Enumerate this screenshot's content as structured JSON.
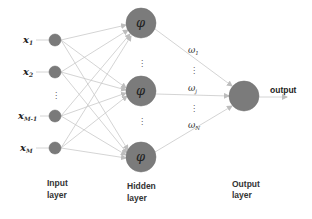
{
  "diagram": {
    "type": "neural-network",
    "layers": {
      "input": {
        "label_line1": "Input",
        "label_line2": "layer"
      },
      "hidden": {
        "label_line1": "Hidden",
        "label_line2": "layer"
      },
      "output": {
        "label_line1": "Output",
        "label_line2": "layer"
      }
    },
    "input_nodes": [
      {
        "symbol": "x",
        "sub": "1"
      },
      {
        "symbol": "x",
        "sub": "2"
      },
      {
        "symbol": "x",
        "sub": "M-1"
      },
      {
        "symbol": "x",
        "sub": "M"
      }
    ],
    "hidden_nodes": [
      {
        "symbol": "φ"
      },
      {
        "symbol": "φ"
      },
      {
        "symbol": "φ"
      }
    ],
    "weights": [
      {
        "symbol": "ω",
        "sub": "1"
      },
      {
        "symbol": "ω",
        "sub": "j"
      },
      {
        "symbol": "ω",
        "sub": "N"
      }
    ],
    "ellipsis": "⋮",
    "output_label": "output",
    "colors": {
      "node": "#7b7b7b",
      "edge": "#c9c9c9",
      "text": "#222222",
      "background": "#ffffff"
    }
  }
}
